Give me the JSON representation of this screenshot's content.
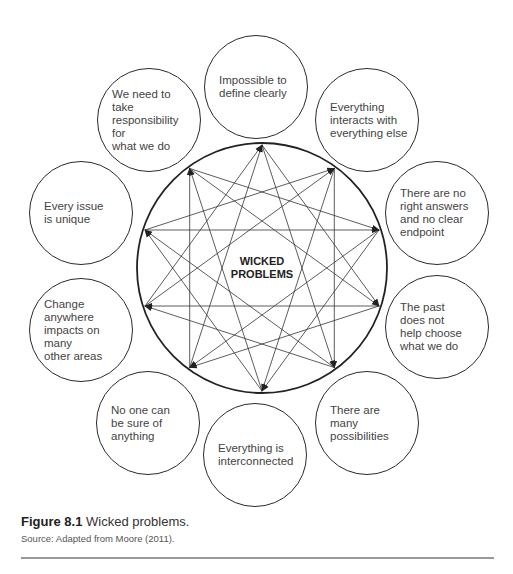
{
  "diagram": {
    "center_label": "WICKED\nPROBLEMS",
    "nodes": [
      {
        "id": "impossible",
        "text": "Impossible to\ndefine clearly",
        "cx": 256,
        "cy": 87
      },
      {
        "id": "interacts",
        "text": "Everything\ninteracts with\neverything else",
        "cx": 367,
        "cy": 120
      },
      {
        "id": "no-right-answers",
        "text": "There are no\nright answers\nand no clear\nendpoint",
        "cx": 437,
        "cy": 213
      },
      {
        "id": "past",
        "text": "The past\ndoes not\nhelp choose\nwhat we do",
        "cx": 437,
        "cy": 327
      },
      {
        "id": "possibilities",
        "text": "There are\nmany\npossibilities",
        "cx": 367,
        "cy": 423
      },
      {
        "id": "interconnected",
        "text": "Everything is\ninterconnected",
        "cx": 255,
        "cy": 455
      },
      {
        "id": "no-one-sure",
        "text": "No one can\nbe sure of\nanything",
        "cx": 148,
        "cy": 423
      },
      {
        "id": "change-anywhere",
        "text": "Change anywhere\nimpacts on many\nother areas",
        "cx": 81,
        "cy": 330
      },
      {
        "id": "unique",
        "text": "Every issue\nis unique",
        "cx": 81,
        "cy": 213
      },
      {
        "id": "responsibility",
        "text": "We need to take\nresponsibility for\nwhat we do",
        "cx": 149,
        "cy": 120
      }
    ]
  },
  "caption": {
    "label": "Figure 8.1",
    "text": " Wicked problems."
  },
  "source": "Source: Adapted from Moore (2011)."
}
